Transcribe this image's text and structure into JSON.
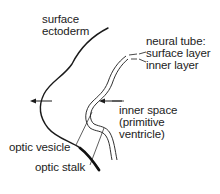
{
  "diagram": {
    "colors": {
      "line": "#1a1a1a",
      "text": "#222222",
      "background": "#ffffff"
    },
    "labels": {
      "surface_ectoderm": [
        "surface",
        "ectoderm"
      ],
      "neural_tube": [
        "neural tube:",
        "surface layer",
        "inner layer"
      ],
      "inner_space": [
        "inner space",
        "(primitive",
        "ventricle)"
      ],
      "optic_vesicle": "optic vesicle",
      "optic_stalk": "optic stalk"
    },
    "arrows": [
      {
        "name": "outer-arrow",
        "direction": "left"
      },
      {
        "name": "inner-arrow",
        "direction": "left"
      }
    ]
  }
}
